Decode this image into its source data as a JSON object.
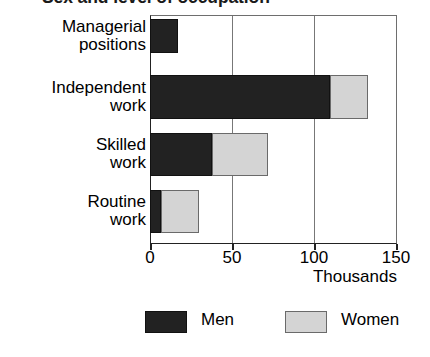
{
  "chart_data": {
    "type": "bar",
    "orientation": "horizontal",
    "stacked": true,
    "title": "Sex and level of occupation",
    "title_visible": "clipped",
    "categories": [
      "Managerial positions",
      "Independent work",
      "Skilled work",
      "Routine work"
    ],
    "series": [
      {
        "name": "Men",
        "color": "#222222",
        "values": [
          17,
          110,
          38,
          7
        ]
      },
      {
        "name": "Women",
        "color": "#d4d4d4",
        "values": [
          0,
          23,
          34,
          23
        ]
      }
    ],
    "xlabel": "Thousands",
    "ylabel": "",
    "xlim": [
      0,
      150
    ],
    "xticks": [
      0,
      50,
      100,
      150
    ],
    "xtick_labels": [
      "0",
      "50",
      "100",
      "150"
    ],
    "grid": true,
    "grid_axis": "x",
    "legend_position": "bottom",
    "legend": [
      "Men",
      "Women"
    ]
  },
  "category_lines": [
    [
      "Managerial",
      "positions"
    ],
    [
      "Independent",
      "work"
    ],
    [
      "Skilled",
      "work"
    ],
    [
      "Routine",
      "work"
    ]
  ],
  "axis": {
    "unit_label": "Thousands"
  },
  "legend_items": [
    {
      "label": "Men",
      "color": "#222222"
    },
    {
      "label": "Women",
      "color": "#d4d4d4"
    }
  ]
}
